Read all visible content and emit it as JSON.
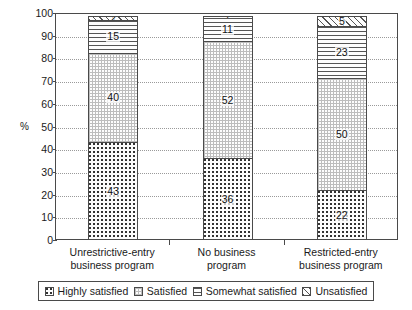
{
  "chart_data": {
    "type": "bar",
    "stacked": true,
    "title": "",
    "xlabel": "",
    "ylabel": "%",
    "ylim": [
      0,
      100
    ],
    "ytick_step": 10,
    "ytick_labels": [
      "100",
      "90",
      "80",
      "70",
      "60",
      "50",
      "40",
      "30",
      "20",
      "10",
      "0"
    ],
    "grid": true,
    "legend_position": "bottom",
    "categories": [
      "Unrestrictive-entry business program",
      "No business program",
      "Restricted-entry business program"
    ],
    "categories_lines": [
      [
        "Unrestrictive-entry",
        "business program"
      ],
      [
        "No business",
        "program"
      ],
      [
        "Restricted-entry",
        "business program"
      ]
    ],
    "series": [
      {
        "name": "Highly satisfied",
        "pattern": "dot-grid",
        "values": [
          43,
          36,
          22
        ]
      },
      {
        "name": "Satisfied",
        "pattern": "fine-stipple",
        "values": [
          40,
          52,
          50
        ]
      },
      {
        "name": "Somewhat satisfied",
        "pattern": "horizontal-lines",
        "values": [
          15,
          11,
          23
        ]
      },
      {
        "name": "Unsatisfied",
        "pattern": "diagonal-hatch",
        "values": [
          2,
          1,
          5
        ]
      }
    ]
  },
  "colors": {
    "axis": "#4a4a4a",
    "grid": "#9a9a9a",
    "text": "#1a1a1a",
    "background": "#ffffff"
  }
}
